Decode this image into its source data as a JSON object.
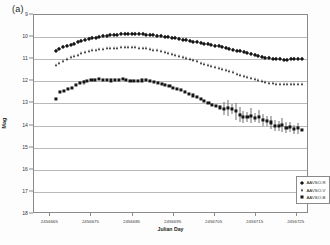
{
  "panel": {
    "label": "(a)"
  },
  "legend": {
    "position": "bottom-right",
    "entries": [
      {
        "label": "AAVSO-R",
        "marker": "diamond"
      },
      {
        "label": "AAVSO-V",
        "marker": "triangle"
      },
      {
        "label": "AAVSO-B",
        "marker": "square"
      }
    ]
  },
  "axes": {
    "y_title": "Mag",
    "x_title": "Julian Day",
    "y_ticks": [
      "9",
      "10",
      "11",
      "12",
      "13",
      "14",
      "15",
      "16",
      "17",
      "18"
    ],
    "x_ticks": [
      "2456665",
      "2456675",
      "2456685",
      "2456695",
      "2456705",
      "2456715",
      "2456725"
    ]
  },
  "colors": {
    "marker": "#151515",
    "grid": "#b9b9b9",
    "frame": "#8a8a8a",
    "errorbar": "#6f6f6f"
  },
  "chart_data": {
    "type": "scatter",
    "title": "",
    "subtitle": "",
    "xlabel": "Julian Day",
    "ylabel": "Mag",
    "xlim": [
      2456661,
      2456728
    ],
    "ylim": [
      18,
      9
    ],
    "y_inverted": true,
    "grid": true,
    "legend_position": "bottom-right",
    "annotations": [
      "(a)"
    ],
    "series": [
      {
        "name": "AAVSO-R",
        "marker": "diamond",
        "x": [
          2456666.4,
          2456667.2,
          2456668.1,
          2456669.0,
          2456669.9,
          2456670.8,
          2456671.6,
          2456672.5,
          2456673.4,
          2456674.3,
          2456675.2,
          2456676.0,
          2456676.9,
          2456677.8,
          2456678.7,
          2456679.6,
          2456680.4,
          2456681.3,
          2456682.2,
          2456683.1,
          2456684.0,
          2456684.8,
          2456685.7,
          2456686.6,
          2456687.5,
          2456688.4,
          2456689.2,
          2456690.1,
          2456691.0,
          2456691.9,
          2456692.8,
          2456693.6,
          2456694.5,
          2456695.4,
          2456696.3,
          2456697.2,
          2456698.0,
          2456698.9,
          2456699.8,
          2456700.7,
          2456701.6,
          2456702.4,
          2456703.3,
          2456704.2,
          2456705.1,
          2456706.0,
          2456706.8,
          2456707.7,
          2456708.6,
          2456709.5,
          2456710.4,
          2456711.2,
          2456712.1,
          2456713.0,
          2456713.9,
          2456714.8,
          2456715.6,
          2456716.5,
          2456717.4,
          2456718.3,
          2456719.2,
          2456720.0,
          2456720.9,
          2456721.8,
          2456722.7,
          2456723.6,
          2456724.4,
          2456725.3,
          2456726.2
        ],
        "y": [
          10.62,
          10.52,
          10.44,
          10.38,
          10.34,
          10.3,
          10.24,
          10.18,
          10.14,
          10.1,
          10.06,
          10.02,
          9.99,
          9.96,
          9.94,
          9.92,
          9.9,
          9.89,
          9.88,
          9.87,
          9.86,
          9.86,
          9.86,
          9.87,
          9.88,
          9.89,
          9.9,
          9.92,
          9.94,
          9.96,
          9.98,
          10.0,
          10.02,
          10.05,
          10.08,
          10.11,
          10.14,
          10.17,
          10.2,
          10.23,
          10.26,
          10.29,
          10.32,
          10.35,
          10.38,
          10.41,
          10.45,
          10.49,
          10.53,
          10.57,
          10.61,
          10.65,
          10.69,
          10.73,
          10.77,
          10.81,
          10.85,
          10.89,
          10.93,
          10.96,
          10.98,
          11.0,
          11.01,
          11.02,
          11.02,
          11.01,
          11.01,
          11.0,
          11.0
        ]
      },
      {
        "name": "AAVSO-V",
        "marker": "triangle",
        "x": [
          2456666.4,
          2456667.2,
          2456668.1,
          2456669.0,
          2456669.9,
          2456670.8,
          2456671.6,
          2456672.5,
          2456673.4,
          2456674.3,
          2456675.2,
          2456676.0,
          2456676.9,
          2456677.8,
          2456678.7,
          2456679.6,
          2456680.4,
          2456681.3,
          2456682.2,
          2456683.1,
          2456684.0,
          2456684.8,
          2456685.7,
          2456686.6,
          2456687.5,
          2456688.4,
          2456689.2,
          2456690.1,
          2456691.0,
          2456691.9,
          2456692.8,
          2456693.6,
          2456694.5,
          2456695.4,
          2456696.3,
          2456697.2,
          2456698.0,
          2456698.9,
          2456699.8,
          2456700.7,
          2456701.6,
          2456702.4,
          2456703.3,
          2456704.2,
          2456705.1,
          2456706.0,
          2456706.8,
          2456707.7,
          2456708.6,
          2456709.5,
          2456710.4,
          2456711.2,
          2456712.1,
          2456713.0,
          2456713.9,
          2456714.8,
          2456715.6,
          2456716.5,
          2456717.4,
          2456718.3,
          2456719.2,
          2456720.0,
          2456720.9,
          2456721.8,
          2456722.7,
          2456723.6,
          2456724.4,
          2456725.3,
          2456726.2
        ],
        "y": [
          11.28,
          11.18,
          11.08,
          10.99,
          10.92,
          10.86,
          10.8,
          10.74,
          10.69,
          10.64,
          10.6,
          10.57,
          10.54,
          10.52,
          10.5,
          10.49,
          10.48,
          10.47,
          10.46,
          10.46,
          10.45,
          10.45,
          10.46,
          10.47,
          10.49,
          10.51,
          10.54,
          10.57,
          10.6,
          10.64,
          10.68,
          10.72,
          10.76,
          10.8,
          10.85,
          10.9,
          10.95,
          11.0,
          11.05,
          11.1,
          11.15,
          11.2,
          11.25,
          11.3,
          11.35,
          11.4,
          11.45,
          11.5,
          11.55,
          11.6,
          11.65,
          11.7,
          11.75,
          11.8,
          11.85,
          11.9,
          11.95,
          12.0,
          12.04,
          12.07,
          12.09,
          12.11,
          12.12,
          12.13,
          12.13,
          12.13,
          12.12,
          12.12,
          12.11
        ]
      },
      {
        "name": "AAVSO-B",
        "marker": "square",
        "x": [
          2456666.4,
          2456667.4,
          2456668.3,
          2456669.3,
          2456670.2,
          2456671.2,
          2456672.1,
          2456673.1,
          2456674.0,
          2456675.0,
          2456675.9,
          2456676.9,
          2456677.8,
          2456678.8,
          2456679.7,
          2456680.7,
          2456681.6,
          2456682.6,
          2456683.5,
          2456684.5,
          2456685.4,
          2456686.4,
          2456687.3,
          2456688.3,
          2456689.2,
          2456690.2,
          2456691.1,
          2456692.1,
          2456693.0,
          2456694.0,
          2456694.9,
          2456695.9,
          2456696.8,
          2456697.8,
          2456698.7,
          2456699.7,
          2456700.6,
          2456701.6,
          2456702.5,
          2456703.5,
          2456704.4,
          2456705.4,
          2456706.3,
          2456707.3,
          2456708.2,
          2456709.2,
          2456710.1,
          2456711.1,
          2456712.0,
          2456713.0,
          2456713.9,
          2456714.9,
          2456715.8,
          2456716.8,
          2456717.7,
          2456718.7,
          2456719.6,
          2456720.6,
          2456721.5,
          2456722.5,
          2456723.4,
          2456724.4,
          2456725.3,
          2456726.3
        ],
        "y": [
          12.78,
          12.5,
          12.44,
          12.34,
          12.28,
          12.18,
          12.06,
          12.04,
          11.98,
          11.94,
          11.92,
          11.9,
          11.92,
          11.95,
          11.96,
          11.95,
          11.92,
          11.88,
          11.94,
          11.98,
          12.0,
          11.98,
          11.96,
          11.95,
          11.98,
          12.02,
          12.06,
          12.1,
          12.16,
          12.22,
          12.28,
          12.34,
          12.4,
          12.48,
          12.56,
          12.64,
          12.72,
          12.8,
          12.88,
          12.98,
          13.06,
          13.12,
          13.18,
          13.24,
          13.22,
          13.26,
          13.36,
          13.5,
          13.6,
          13.62,
          13.55,
          13.64,
          13.6,
          13.74,
          13.78,
          13.86,
          14.0,
          14.02,
          13.98,
          14.1,
          14.06,
          14.16,
          14.12,
          14.2
        ],
        "yerr": [
          0,
          0,
          0,
          0,
          0,
          0,
          0,
          0.12,
          0,
          0,
          0,
          0,
          0,
          0,
          0,
          0,
          0,
          0,
          0,
          0,
          0,
          0,
          0,
          0,
          0,
          0,
          0,
          0,
          0,
          0,
          0,
          0,
          0,
          0,
          0,
          0,
          0,
          0,
          0,
          0,
          0,
          0,
          0,
          0.3,
          0.36,
          0.22,
          0.4,
          0.34,
          0.28,
          0.22,
          0.34,
          0.2,
          0.3,
          0.26,
          0.22,
          0.3,
          0.26,
          0.22,
          0.3,
          0.24,
          0.22,
          0.2,
          0.24
        ]
      }
    ]
  }
}
